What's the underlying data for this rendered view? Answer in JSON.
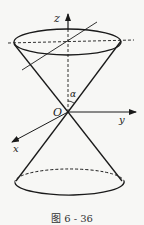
{
  "figure": {
    "caption": "图 6 - 36",
    "labels": {
      "z_axis": "z",
      "y_axis": "y",
      "x_axis": "x",
      "origin": "O",
      "angle": "α"
    },
    "colors": {
      "stroke": "#1a1a1a",
      "background": "#f7f7f5"
    }
  }
}
